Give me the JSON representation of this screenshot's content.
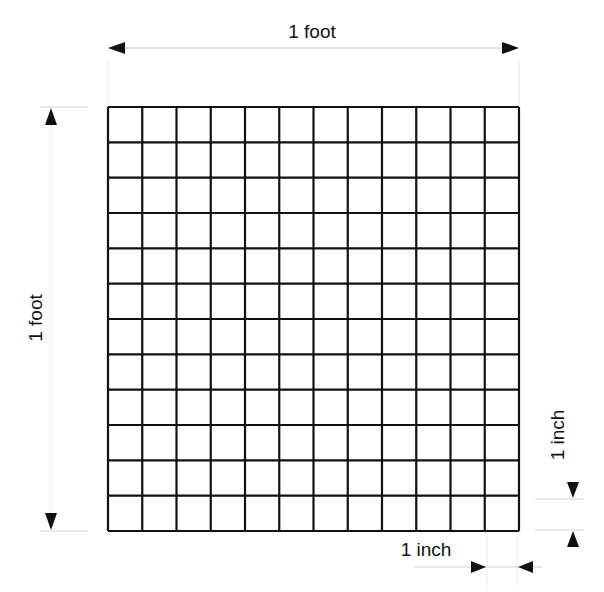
{
  "diagram": {
    "grid": {
      "rows": 12,
      "cols": 12,
      "left": 108,
      "top": 107,
      "right": 519,
      "bottom": 531,
      "line_color": "#111111"
    },
    "dimensions": {
      "top": {
        "label": "1 foot"
      },
      "left": {
        "label": "1 foot"
      },
      "right_inch": {
        "label": "1 inch"
      },
      "bottom_inch": {
        "label": "1 inch"
      }
    },
    "colors": {
      "background": "#ffffff",
      "grid": "#111111",
      "guide": "#d0d0d0",
      "arrow": "#111111"
    }
  }
}
